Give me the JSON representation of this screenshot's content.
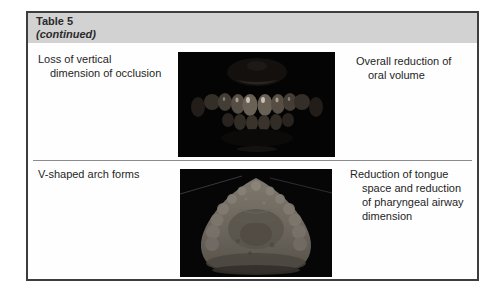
{
  "table": {
    "header": {
      "title": "Table 5",
      "subtitle": "(continued)"
    },
    "rows": [
      {
        "finding_lines": [
          "Loss of vertical",
          "dimension of occlusion"
        ],
        "consequence_lines": [
          "Overall reduction of",
          "oral volume"
        ],
        "image": "intraoral-photo-of-teeth-in-occlusion"
      },
      {
        "finding_lines": [
          "V-shaped arch forms"
        ],
        "consequence_lines": [
          "Reduction of tongue",
          "space and reduction",
          "of pharyngeal airway",
          "dimension"
        ],
        "image": "dental-cast-v-shaped-arch"
      }
    ]
  },
  "colors": {
    "header_bg": "#d2d2d2",
    "frame_border": "#3d3d3d",
    "divider": "#8c8c8c",
    "photo_bg": "#050505"
  }
}
